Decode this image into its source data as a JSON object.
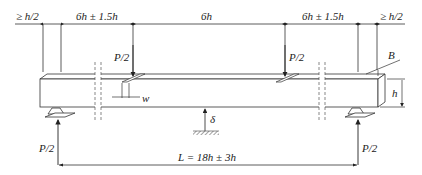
{
  "diagram": {
    "dimensions_top": [
      {
        "id": "overhang_left",
        "label": "≥ h/2"
      },
      {
        "id": "shear_span_left",
        "label": "6h ± 1.5h"
      },
      {
        "id": "middle_span",
        "label": "6h"
      },
      {
        "id": "shear_span_right",
        "label": "6h ± 1.5h"
      },
      {
        "id": "overhang_right",
        "label": "≥ h/2"
      }
    ],
    "loads": [
      {
        "id": "load_left",
        "label": "P/2"
      },
      {
        "id": "load_right",
        "label": "P/2"
      }
    ],
    "reactions": [
      {
        "id": "reaction_left",
        "label": "P/2"
      },
      {
        "id": "reaction_right",
        "label": "P/2"
      }
    ],
    "beam": {
      "width_label": "B",
      "height_label": "h",
      "plate_width_label": "w"
    },
    "deflection_label": "δ",
    "span_label": "L = 18h ± 3h"
  }
}
